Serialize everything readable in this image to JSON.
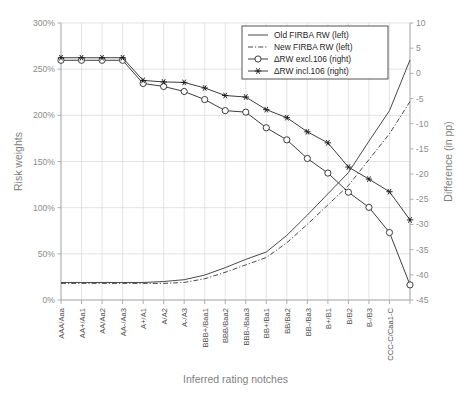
{
  "chart_data": {
    "type": "line",
    "title": "",
    "xlabel": "Inferred rating notches",
    "ylabel": "Risk weights",
    "y2label": "Difference (in pp)",
    "ylim": [
      0,
      300
    ],
    "y2lim": [
      -45,
      10
    ],
    "ytick_labels": [
      "300%",
      "250%",
      "200%",
      "150%",
      "100%",
      "50%",
      "0%"
    ],
    "ytick_values": [
      300,
      250,
      200,
      150,
      100,
      50,
      0
    ],
    "y2tick_labels": [
      "10",
      "5",
      "0",
      "-5",
      "-10",
      "-15",
      "-20",
      "-25",
      "-30",
      "-35",
      "-40",
      "-45"
    ],
    "y2tick_values": [
      10,
      5,
      0,
      -5,
      -10,
      -15,
      -20,
      -25,
      -30,
      -35,
      -40,
      -45
    ],
    "grid": true,
    "legend_position": "top-right",
    "categories": [
      "AAA/Aaa",
      "AA+/Aa1",
      "AA/Aa2",
      "AA-/Aa3",
      "A+/A1",
      "A/A2",
      "A-/A3",
      "BBB+/Baa1",
      "BBB/Baa2",
      "BBB-/Baa3",
      "BB+/Ba1",
      "BB/Ba2",
      "BB-/Ba3",
      "B+/B1",
      "B/B2",
      "B-/B3",
      "CCC-C/Caa1-C",
      ""
    ],
    "series": [
      {
        "name": "Old FIRBA RW (left)",
        "axis": "left",
        "style": "solid",
        "marker": "none",
        "values": [
          19,
          19,
          19,
          19,
          19,
          20,
          22,
          27,
          35,
          44,
          52,
          70,
          92,
          115,
          138,
          172,
          205,
          260
        ]
      },
      {
        "name": "New FIRBA RW (left)",
        "axis": "left",
        "style": "dashdot",
        "marker": "none",
        "values": [
          18,
          18,
          18,
          18,
          18,
          18,
          19,
          23,
          30,
          38,
          46,
          62,
          82,
          103,
          124,
          152,
          180,
          215
        ]
      },
      {
        "name": "ΔRW excl.106 (right)",
        "axis": "right",
        "style": "solid",
        "marker": "circle",
        "values": [
          2.6,
          2.6,
          2.6,
          2.6,
          -2.0,
          -2.6,
          -3.6,
          -5.2,
          -7.4,
          -7.7,
          -10.8,
          -13.2,
          -16.9,
          -19.8,
          -23.6,
          -26.6,
          -31.6,
          -42.0
        ]
      },
      {
        "name": "ΔRW incl.106 (right)",
        "axis": "right",
        "style": "solid",
        "marker": "star",
        "values": [
          3.1,
          3.1,
          3.1,
          3.1,
          -1.4,
          -1.7,
          -1.8,
          -2.9,
          -4.4,
          -4.7,
          -7.2,
          -8.8,
          -11.6,
          -13.8,
          -18.6,
          -21.0,
          -23.5,
          -29.1
        ]
      }
    ]
  },
  "colors": {
    "grid": "#d9d9d9",
    "axis": "#a6a6a6",
    "series": "#333333",
    "axis_title": "#7f7f7f",
    "tick_label": "#8c8c8c",
    "xtick_label": "#4d4d4d",
    "background": "#ffffff"
  }
}
